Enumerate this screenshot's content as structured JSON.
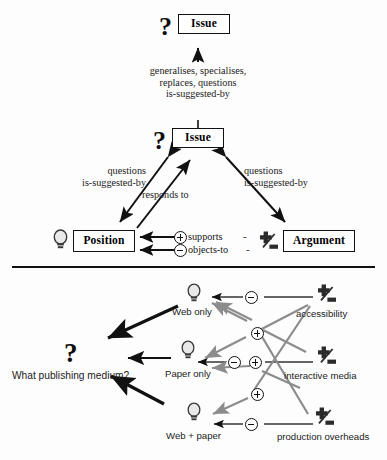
{
  "diagram": {
    "upper": {
      "nodes": [
        {
          "id": "issue-top",
          "label": "Issue",
          "icon": "question-mark-icon"
        },
        {
          "id": "issue-middle",
          "label": "Issue",
          "icon": "question-mark-icon"
        },
        {
          "id": "position",
          "label": "Position",
          "icon": "lightbulb-icon"
        },
        {
          "id": "argument",
          "label": "Argument",
          "icon": "argument-plus-minus-icon"
        }
      ],
      "edge_labels": [
        {
          "id": "issue-to-issue",
          "lines": [
            "generalises, specialises,",
            "replaces, questions",
            "is-suggested-by"
          ]
        },
        {
          "id": "issue-to-position",
          "lines": [
            "questions",
            "is-suggested-by"
          ]
        },
        {
          "id": "position-to-issue",
          "lines": [
            "responds to"
          ]
        },
        {
          "id": "issue-to-argument",
          "lines": [
            "questions",
            "is-suggested-by"
          ]
        }
      ],
      "link_types": [
        {
          "id": "supports",
          "label": "supports",
          "sign": "+",
          "dash": "-"
        },
        {
          "id": "objects-to",
          "label": "objects-to",
          "sign": "−",
          "dash": "-"
        }
      ]
    },
    "lower": {
      "question": {
        "icon": "question-mark-icon",
        "label": "What publishing medium?"
      },
      "positions": [
        {
          "id": "web-only",
          "label": "Web only",
          "icon": "lightbulb-icon"
        },
        {
          "id": "paper-only",
          "label": "Paper only",
          "icon": "lightbulb-icon"
        },
        {
          "id": "web-paper",
          "label": "Web + paper",
          "icon": "lightbulb-icon"
        }
      ],
      "arguments": [
        {
          "id": "accessibility",
          "label": "accessibility",
          "icon": "argument-plus-minus-icon"
        },
        {
          "id": "interactive-media",
          "label": "interactive media",
          "icon": "argument-plus-minus-icon"
        },
        {
          "id": "production-overheads",
          "label": "production overheads",
          "icon": "argument-plus-minus-icon"
        }
      ],
      "links": [
        {
          "from": "accessibility",
          "to": "web-only",
          "sign": "−"
        },
        {
          "from": "accessibility",
          "to": "paper-only",
          "sign": "+"
        },
        {
          "from": "accessibility",
          "to": "web-paper",
          "sign": "+"
        },
        {
          "from": "interactive-media",
          "to": "web-only",
          "sign": "+"
        },
        {
          "from": "interactive-media",
          "to": "paper-only",
          "sign": "−"
        },
        {
          "from": "production-overheads",
          "to": "web-paper",
          "sign": "−"
        }
      ]
    },
    "colors": {
      "ink": "#111111",
      "gray_arrow": "#8c8c8c",
      "paper": "#fdfdfd",
      "bulb_body": "#e8e8e8"
    }
  }
}
